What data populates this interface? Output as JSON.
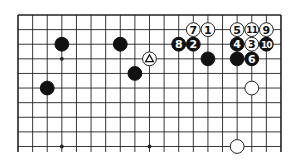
{
  "diagram": {
    "type": "go-board-partial",
    "colors": {
      "background": "#ffffff",
      "line": "#222222",
      "black_stone": "#111111",
      "white_stone": "#ffffff",
      "white_stone_stroke": "#222222",
      "black_label": "#ffffff",
      "white_label": "#111111"
    },
    "grid": {
      "origin_x": 18,
      "origin_y": 15,
      "spacing": 14.61,
      "columns": 19,
      "rows_visible": 10,
      "line_extend_bottom": 152,
      "edges": {
        "top": true,
        "left": true,
        "right": true,
        "bottom": false
      }
    },
    "star_points": [
      {
        "col": 3,
        "row": 3
      },
      {
        "col": 9,
        "row": 3
      },
      {
        "col": 15,
        "row": 3
      },
      {
        "col": 3,
        "row": 9
      },
      {
        "col": 9,
        "row": 9
      },
      {
        "col": 15,
        "row": 9
      }
    ],
    "stones": [
      {
        "color": "black",
        "col": 3,
        "row": 2,
        "label": ""
      },
      {
        "color": "black",
        "col": 7,
        "row": 2,
        "label": ""
      },
      {
        "color": "black",
        "col": 2,
        "row": 5,
        "label": ""
      },
      {
        "color": "black",
        "col": 8,
        "row": 4,
        "label": ""
      },
      {
        "color": "white",
        "col": 9,
        "row": 3,
        "label": "",
        "marker": "triangle"
      },
      {
        "color": "white",
        "col": 13,
        "row": 1,
        "label": "1"
      },
      {
        "color": "black",
        "col": 12,
        "row": 2,
        "label": "2"
      },
      {
        "color": "white",
        "col": 16,
        "row": 2,
        "label": "3"
      },
      {
        "color": "black",
        "col": 15,
        "row": 2,
        "label": "4"
      },
      {
        "color": "white",
        "col": 15,
        "row": 1,
        "label": "5"
      },
      {
        "color": "black",
        "col": 16,
        "row": 3,
        "label": "6"
      },
      {
        "color": "white",
        "col": 12,
        "row": 1,
        "label": "7"
      },
      {
        "color": "black",
        "col": 11,
        "row": 2,
        "label": "8"
      },
      {
        "color": "white",
        "col": 17,
        "row": 1,
        "label": "9"
      },
      {
        "color": "black",
        "col": 17,
        "row": 2,
        "label": "10"
      },
      {
        "color": "white",
        "col": 16,
        "row": 1,
        "label": "11"
      },
      {
        "color": "black",
        "col": 13,
        "row": 3,
        "label": ""
      },
      {
        "color": "black",
        "col": 15,
        "row": 3,
        "label": ""
      },
      {
        "color": "white",
        "col": 16,
        "row": 5,
        "label": ""
      },
      {
        "color": "white",
        "col": 15,
        "row": 9,
        "label": ""
      }
    ]
  }
}
